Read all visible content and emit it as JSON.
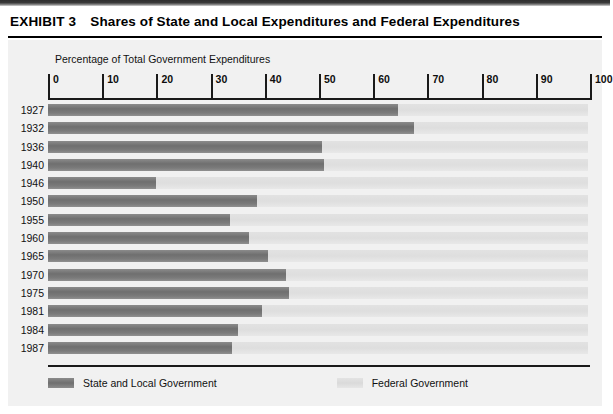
{
  "exhibit": {
    "label": "EXHIBIT 3",
    "title": "Shares of State and Local Expenditures and Federal Expenditures"
  },
  "chart_data": {
    "type": "bar",
    "orientation": "horizontal",
    "stacked": true,
    "title": "Shares of State and Local Expenditures and Federal Expenditures",
    "axis_caption": "Percentage of Total Government Expenditures",
    "xlabel": "Percentage of Total Government Expenditures",
    "ylabel": "",
    "xlim": [
      0,
      100
    ],
    "ticks": [
      0,
      10,
      20,
      30,
      40,
      50,
      60,
      70,
      80,
      90,
      100
    ],
    "tick_labels": [
      "0",
      "10",
      "20",
      "30",
      "40",
      "50",
      "60",
      "70",
      "80",
      "90",
      "100"
    ],
    "grid": false,
    "legend_position": "bottom",
    "categories": [
      "1927",
      "1932",
      "1936",
      "1940",
      "1946",
      "1950",
      "1955",
      "1960",
      "1965",
      "1970",
      "1975",
      "1981",
      "1984",
      "1987"
    ],
    "series": [
      {
        "name": "State and Local Government",
        "color": "#7a7a7a",
        "values": [
          64.5,
          67.5,
          50.5,
          51.0,
          20.0,
          38.5,
          33.5,
          37.0,
          40.5,
          44.0,
          44.5,
          39.5,
          35.0,
          34.0
        ]
      },
      {
        "name": "Federal Government",
        "color": "#dedede",
        "values": [
          35.5,
          32.5,
          49.5,
          49.0,
          80.0,
          61.5,
          66.5,
          63.0,
          59.5,
          56.0,
          55.5,
          60.5,
          65.0,
          66.0
        ]
      }
    ],
    "rows": [
      {
        "year": "1927",
        "state_local": 64.5,
        "federal": 35.5
      },
      {
        "year": "1932",
        "state_local": 67.5,
        "federal": 32.5
      },
      {
        "year": "1936",
        "state_local": 50.5,
        "federal": 49.5
      },
      {
        "year": "1940",
        "state_local": 51.0,
        "federal": 49.0
      },
      {
        "year": "1946",
        "state_local": 20.0,
        "federal": 80.0
      },
      {
        "year": "1950",
        "state_local": 38.5,
        "federal": 61.5
      },
      {
        "year": "1955",
        "state_local": 33.5,
        "federal": 66.5
      },
      {
        "year": "1960",
        "state_local": 37.0,
        "federal": 63.0
      },
      {
        "year": "1965",
        "state_local": 40.5,
        "federal": 59.5
      },
      {
        "year": "1970",
        "state_local": 44.0,
        "federal": 56.0
      },
      {
        "year": "1975",
        "state_local": 44.5,
        "federal": 55.5
      },
      {
        "year": "1981",
        "state_local": 39.5,
        "federal": 60.5
      },
      {
        "year": "1984",
        "state_local": 35.0,
        "federal": 65.0
      },
      {
        "year": "1987",
        "state_local": 34.0,
        "federal": 66.0
      }
    ],
    "legend": [
      {
        "label": "State and Local Government",
        "color": "#7a7a7a"
      },
      {
        "label": "Federal Government",
        "color": "#dedede"
      }
    ]
  },
  "colors": {
    "state_local": "#7a7a7a",
    "federal": "#dedede",
    "panel_bg": "#f1f1f1",
    "axis": "#1a1a1a",
    "text": "#101010"
  }
}
